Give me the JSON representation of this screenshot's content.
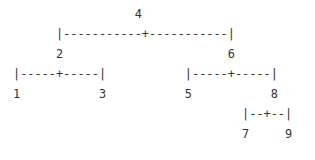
{
  "diagram": {
    "type": "binary-tree-ascii",
    "lines": [
      "                 4",
      "      |-----------+-----------|",
      "      2                       6",
      "|-----+-----|           |-----+-----|",
      "1           3           5           8",
      "                                |--+--|",
      "                                7     9"
    ],
    "nodes": [
      {
        "value": "4",
        "children": [
          "2",
          "6"
        ]
      },
      {
        "value": "2",
        "children": [
          "1",
          "3"
        ]
      },
      {
        "value": "6",
        "children": [
          "5",
          "8"
        ]
      },
      {
        "value": "8",
        "children": [
          "7",
          "9"
        ]
      },
      {
        "value": "1",
        "children": []
      },
      {
        "value": "3",
        "children": []
      },
      {
        "value": "5",
        "children": []
      },
      {
        "value": "7",
        "children": []
      },
      {
        "value": "9",
        "children": []
      }
    ]
  }
}
